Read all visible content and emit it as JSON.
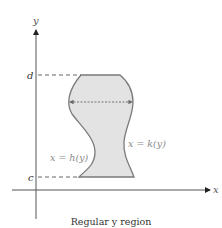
{
  "diagram": {
    "caption": "Regular y region",
    "axes": {
      "x_label": "x",
      "y_label": "y"
    },
    "bounds": {
      "top_label": "d",
      "bottom_label": "c"
    },
    "curves": {
      "left_label": "x = h(y)",
      "right_label": "x = k(y)"
    },
    "colors": {
      "region_fill": "#e3e3e3",
      "region_stroke": "#7a7a7a",
      "axis": "#555555",
      "dashed": "#666666",
      "label_text": "#8a8a8a",
      "caption_text": "#333333"
    }
  }
}
